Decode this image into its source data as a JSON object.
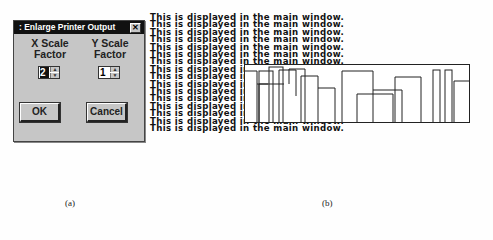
{
  "dialog": {
    "title": ": Enlarge Printer Output",
    "close_label": "✕",
    "x_label_line1": "X Scale",
    "x_label_line2": "Factor",
    "y_label_line1": "Y Scale",
    "y_label_line2": "Factor",
    "x_value": "2",
    "y_value": "1",
    "spin_up": "▲",
    "spin_down": "▼",
    "ok_label": "OK",
    "cancel_label": "Cancel"
  },
  "main_window": {
    "lines": [
      "This is displayed in the main window.",
      "This is displayed in the main window.",
      "This is displayed in the main window.",
      "This is displayed in the main window.",
      "This is displayed in the main window.",
      "This is displayed in the main window.",
      "This is displayed in the main window.",
      "This is displayed in the main window.",
      "This is displayed in the main window.",
      "This is displayed in the main window.",
      "This is displayed in the main window.",
      "This is displayed in the main window.",
      "This is displayed in the main window.",
      "This is displayed in the main window.",
      "This is displayed in the main window.",
      "This is displayed in the main window."
    ]
  },
  "captions": {
    "left": "(a)",
    "right": "(b)"
  }
}
